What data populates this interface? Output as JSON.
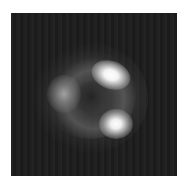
{
  "image": {
    "subject": "gravitational-lens-einstein-ring",
    "background_color": "#1c1c1c",
    "frame_color": "#ffffff",
    "features": [
      {
        "name": "upper-right-bright-image"
      },
      {
        "name": "lower-right-bright-image"
      },
      {
        "name": "left-dim-image"
      },
      {
        "name": "dark-lens-center"
      }
    ]
  }
}
